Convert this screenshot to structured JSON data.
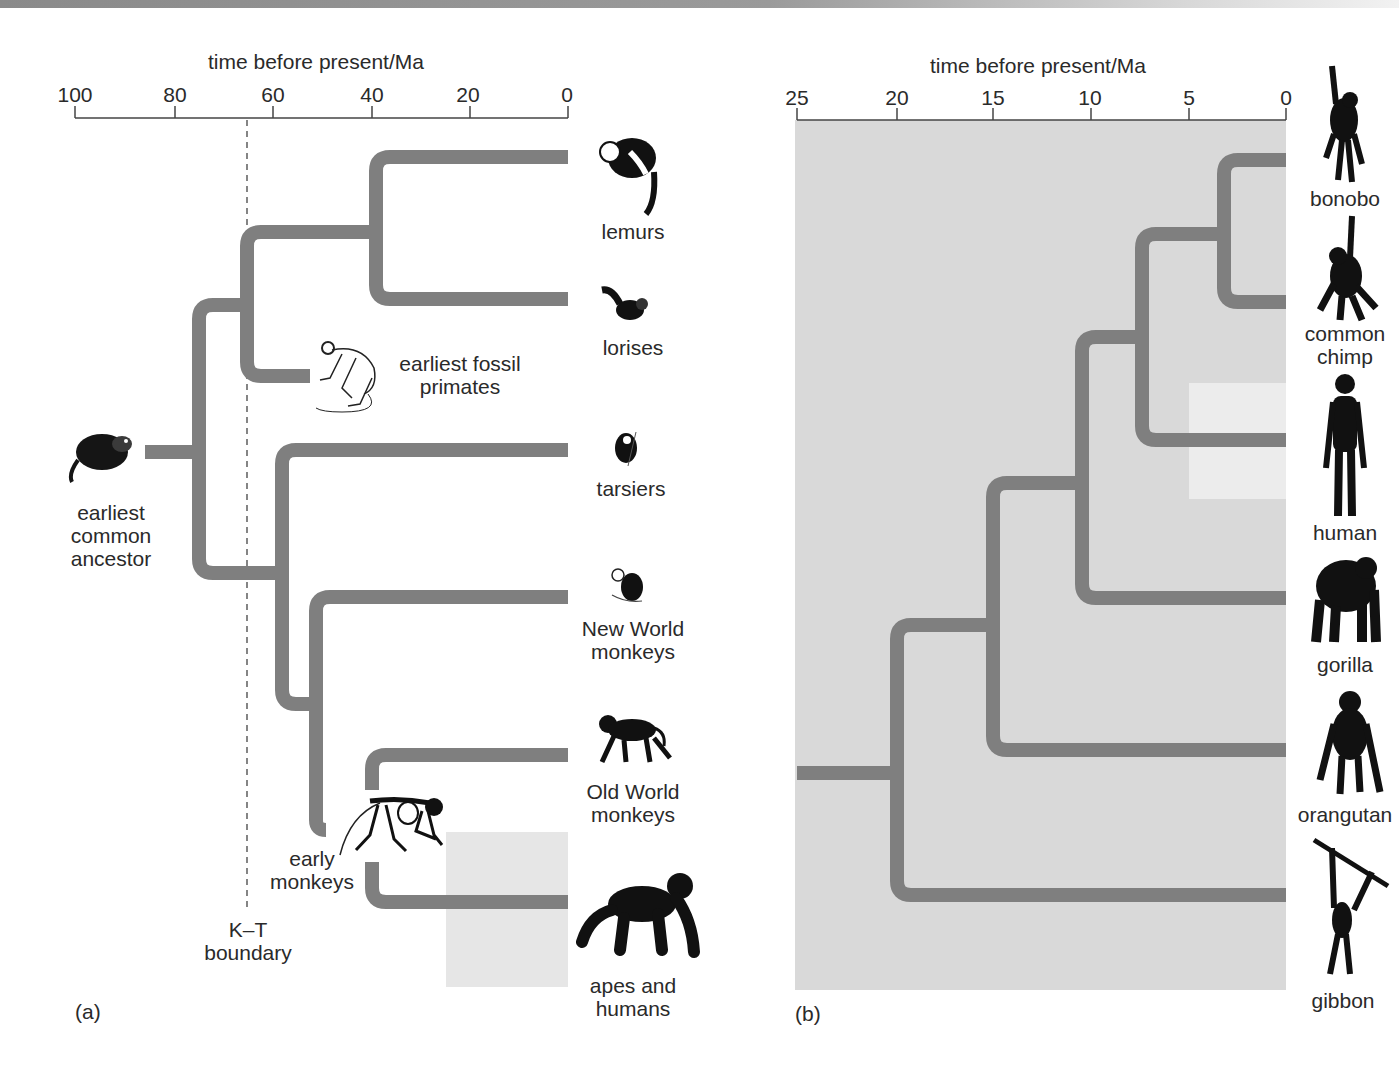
{
  "colors": {
    "branch": "#7f7f7f",
    "panel_b_background": "#d9d9d9",
    "highlight_box": "#e6e6e6",
    "human_highlight": "#ececec",
    "text": "#2a2a2a",
    "silhouette": "#111111"
  },
  "panel_a": {
    "label": "(a)",
    "axis": {
      "title": "time before present/Ma",
      "ticks": [
        "100",
        "80",
        "60",
        "40",
        "20",
        "0"
      ],
      "range": [
        100,
        0
      ]
    },
    "boundary": {
      "label_line1": "K–T",
      "label_line2": "boundary",
      "time_ma": 65
    },
    "root": {
      "label_line1": "earliest",
      "label_line2": "common",
      "label_line3": "ancestor",
      "icon": "shrew-like-mammal-icon"
    },
    "fossil": {
      "label_line1": "earliest fossil",
      "label_line2": "primates",
      "icon": "primate-skeleton-icon"
    },
    "early_monkeys": {
      "label_line1": "early",
      "label_line2": "monkeys",
      "icon": "monkey-skeleton-icon"
    },
    "taxa": [
      {
        "name": "lemurs",
        "label_line1": "lemurs",
        "label_line2": "",
        "icon": "lemur-icon"
      },
      {
        "name": "lorises",
        "label_line1": "lorises",
        "label_line2": "",
        "icon": "loris-icon"
      },
      {
        "name": "tarsiers",
        "label_line1": "tarsiers",
        "label_line2": "",
        "icon": "tarsier-icon"
      },
      {
        "name": "new-world-monkeys",
        "label_line1": "New World",
        "label_line2": "monkeys",
        "icon": "new-world-monkey-icon"
      },
      {
        "name": "old-world-monkeys",
        "label_line1": "Old World",
        "label_line2": "monkeys",
        "icon": "baboon-icon"
      },
      {
        "name": "apes-and-humans",
        "label_line1": "apes and",
        "label_line2": "humans",
        "icon": "chimpanzee-icon"
      }
    ]
  },
  "panel_b": {
    "label": "(b)",
    "axis": {
      "title": "time before present/Ma",
      "ticks": [
        "25",
        "20",
        "15",
        "10",
        "5",
        "0"
      ],
      "range": [
        25,
        0
      ]
    },
    "taxa": [
      {
        "name": "bonobo",
        "label_line1": "bonobo",
        "label_line2": "",
        "icon": "bonobo-silhouette-icon"
      },
      {
        "name": "common-chimp",
        "label_line1": "common",
        "label_line2": "chimp",
        "icon": "chimp-silhouette-icon"
      },
      {
        "name": "human",
        "label_line1": "human",
        "label_line2": "",
        "icon": "human-silhouette-icon"
      },
      {
        "name": "gorilla",
        "label_line1": "gorilla",
        "label_line2": "",
        "icon": "gorilla-silhouette-icon"
      },
      {
        "name": "orangutan",
        "label_line1": "orangutan",
        "label_line2": "",
        "icon": "orangutan-silhouette-icon"
      },
      {
        "name": "gibbon",
        "label_line1": "gibbon",
        "label_line2": "",
        "icon": "gibbon-silhouette-icon"
      }
    ],
    "divergence_times_ma": {
      "bonobo_chimp": 3,
      "chimps_human": 7.5,
      "gorilla": 10.5,
      "orangutan": 15,
      "gibbon": 20
    }
  }
}
